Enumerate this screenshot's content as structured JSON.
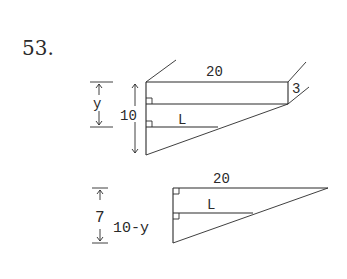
{
  "problem": {
    "number": "53."
  },
  "top_figure": {
    "top_length_label": "20",
    "right_offset_label": "3",
    "height_label": "10",
    "partial_height_label": "y",
    "segment_label": "L"
  },
  "bottom_figure": {
    "top_length_label": "20",
    "segment_label": "L",
    "height_label": "7",
    "partial_height_label": "10-y"
  },
  "colors": {
    "ink": "#2a2a2a",
    "background": "#ffffff"
  }
}
